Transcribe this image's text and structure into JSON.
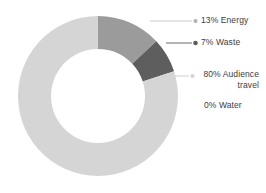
{
  "chart_data": {
    "type": "pie",
    "variant": "donut",
    "title": "",
    "subtitle": "",
    "xlabel": "",
    "ylabel": "",
    "grid": false,
    "legend_position": "right-callout-labels",
    "units": "percent",
    "start_angle_deg": 0,
    "direction": "clockwise",
    "categories": [
      "Energy",
      "Waste",
      "Audience travel",
      "Water"
    ],
    "values": [
      13,
      7,
      80,
      0
    ],
    "labels": [
      "13% Energy",
      "7% Waste",
      "80% Audience travel",
      "0% Water"
    ],
    "colors": [
      "#9b9b9b",
      "#5e5e5e",
      "#d5d5d5",
      "#d5d5d5"
    ],
    "slices": [
      {
        "name": "Energy",
        "value": 13,
        "label": "13% Energy",
        "color": "#9b9b9b",
        "has_leader_line": true,
        "marker_color": "#b3b3b3"
      },
      {
        "name": "Waste",
        "value": 7,
        "label": "7% Waste",
        "color": "#5e5e5e",
        "has_leader_line": true,
        "marker_color": "#5e5e5e"
      },
      {
        "name": "Audience travel",
        "value": 80,
        "label_line1": "80% Audience",
        "label_line2": "travel",
        "label": "80% Audience travel",
        "color": "#d5d5d5",
        "has_leader_line": true,
        "marker_color": "#d5d5d5"
      },
      {
        "name": "Water",
        "value": 0,
        "label": "0% Water",
        "color": "#d5d5d5",
        "has_leader_line": false,
        "marker_color": "#d5d5d5"
      }
    ]
  },
  "geometry": {
    "center_x": 98,
    "center_y": 96,
    "outer_radius": 80,
    "inner_radius": 47
  },
  "style": {
    "background": "#ffffff",
    "text_color": "#3c3c3c",
    "leader_line_color": "#c8c8c8"
  }
}
